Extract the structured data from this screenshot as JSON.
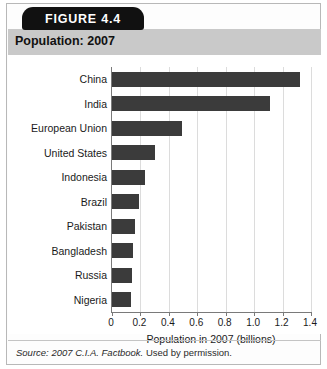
{
  "figure": {
    "tab_label": "FIGURE 4.4",
    "title": "Population: 2007",
    "source": "Source: 2007 C.I.A. Factbook.",
    "source_permission": " Used by permission."
  },
  "chart_data": {
    "type": "bar",
    "orientation": "horizontal",
    "title": "Population: 2007",
    "xlabel": "Population in 2007 (billions)",
    "ylabel": "",
    "xlim": [
      0,
      1.4
    ],
    "xticks": [
      "0",
      "0.2",
      "0.4",
      "0.6",
      "0.8",
      "1.0",
      "1.2",
      "1.4"
    ],
    "xtick_values": [
      0,
      0.2,
      0.4,
      0.6,
      0.8,
      1.0,
      1.2,
      1.4
    ],
    "grid": true,
    "legend": false,
    "bar_color": "#3b3b3b",
    "categories": [
      "China",
      "India",
      "European Union",
      "United States",
      "Indonesia",
      "Brazil",
      "Pakistan",
      "Bangladesh",
      "Russia",
      "Nigeria"
    ],
    "values": [
      1.32,
      1.11,
      0.49,
      0.3,
      0.235,
      0.19,
      0.165,
      0.15,
      0.141,
      0.135
    ],
    "units": "billions"
  }
}
